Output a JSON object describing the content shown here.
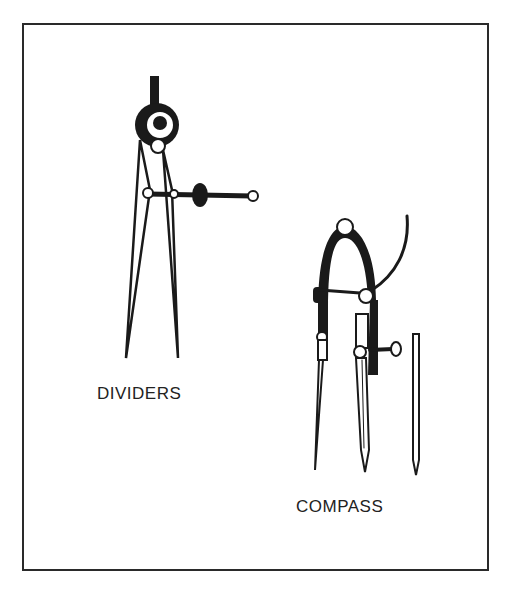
{
  "figure": {
    "items": [
      {
        "name": "dividers",
        "label": "DIVIDERS"
      },
      {
        "name": "compass",
        "label": "COMPASS"
      }
    ]
  },
  "colors": {
    "ink": "#1a1a1a",
    "background": "#ffffff"
  }
}
